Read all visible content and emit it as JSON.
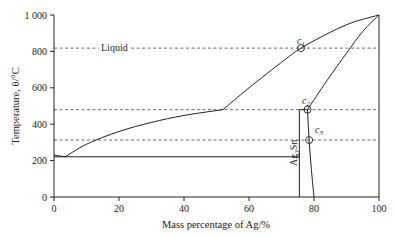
{
  "chart_data": {
    "type": "line",
    "title": "",
    "xlabel": "Mass percentage of Ag/%",
    "ylabel": "Temperature, θ/°C",
    "xlim": [
      0,
      100
    ],
    "ylim": [
      0,
      1000
    ],
    "grid": false,
    "legend": null,
    "x_ticks": [
      0,
      20,
      40,
      60,
      80,
      100
    ],
    "x_tick_labels": [
      "0",
      "20",
      "40",
      "60",
      "80",
      "100"
    ],
    "y_ticks": [
      0,
      200,
      400,
      600,
      800,
      1000
    ],
    "y_tick_labels": [
      "0",
      "200",
      "400",
      "600",
      "800",
      "1 000"
    ],
    "series": [
      {
        "name": "Liquidus (Sn side)",
        "style": "solid",
        "points": [
          [
            0,
            232
          ],
          [
            1.5,
            226
          ],
          [
            3.5,
            221
          ]
        ]
      },
      {
        "name": "Liquidus (to peritectic)",
        "style": "solid",
        "points": [
          [
            3.5,
            221
          ],
          [
            10,
            290
          ],
          [
            20,
            360
          ],
          [
            30,
            410
          ],
          [
            40,
            448
          ],
          [
            52,
            480
          ]
        ]
      },
      {
        "name": "Liquidus (Ag side)",
        "style": "solid",
        "points": [
          [
            52,
            480
          ],
          [
            60,
            600
          ],
          [
            70,
            740
          ],
          [
            76,
            818
          ],
          [
            85,
            905
          ],
          [
            92,
            960
          ],
          [
            100,
            1000
          ]
        ]
      },
      {
        "name": "Solidus (Ag-rich)",
        "style": "solid",
        "points": [
          [
            78,
            480
          ],
          [
            84,
            640
          ],
          [
            90,
            790
          ],
          [
            95,
            910
          ],
          [
            100,
            1000
          ]
        ]
      },
      {
        "name": "Solvus (Ag-rich)",
        "style": "solid",
        "points": [
          [
            78,
            480
          ],
          [
            78.5,
            313
          ],
          [
            79.2,
            150
          ],
          [
            80,
            0
          ]
        ]
      },
      {
        "name": "Ag3Sn phase line",
        "style": "solid",
        "points": [
          [
            75.5,
            0
          ],
          [
            75.5,
            480
          ]
        ]
      },
      {
        "name": "Eutectic isotherm",
        "style": "solid",
        "points": [
          [
            0,
            221
          ],
          [
            75.5,
            221
          ]
        ]
      },
      {
        "name": "Peritectic isotherm",
        "style": "solid",
        "points": [
          [
            75.5,
            480
          ],
          [
            78,
            480
          ]
        ]
      }
    ],
    "reference_lines": [
      {
        "y": 818,
        "style": "dashed",
        "label": "Liquid"
      },
      {
        "y": 480,
        "style": "dashed"
      },
      {
        "y": 313,
        "style": "dashed"
      }
    ],
    "annotations": [
      {
        "text": "Liquid",
        "x": 15,
        "y": 818
      },
      {
        "text": "Ag3Sn",
        "x": 74,
        "y": 350,
        "rotation": -90
      },
      {
        "text": "c1",
        "x": 76,
        "y": 818,
        "marker": "circle"
      },
      {
        "text": "c2",
        "x": 78,
        "y": 480,
        "marker": "circle"
      },
      {
        "text": "c3",
        "x": 78.5,
        "y": 313,
        "marker": "circle"
      }
    ]
  },
  "labels": {
    "xlabel": "Mass percentage of Ag/%",
    "ylabel": "Temperature, θ/°C",
    "liquid": "Liquid",
    "ag3sn_main": "Ag",
    "ag3sn_sub": "3",
    "ag3sn_tail": "Sn",
    "c1_main": "c",
    "c1_sub": "1",
    "c2_main": "c",
    "c2_sub": "2",
    "c3_main": "c",
    "c3_sub": "3"
  },
  "colors": {
    "line": "#222222",
    "dashed": "#444444",
    "background": "#ffffff"
  }
}
